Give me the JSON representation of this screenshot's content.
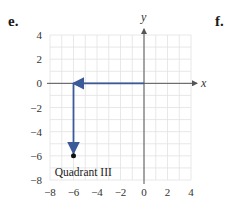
{
  "labels": {
    "left_part": "e.",
    "right_part": "f."
  },
  "colors": {
    "grid": "#e2e2e2",
    "axis": "#555555",
    "path": "#3c5a9a",
    "point": "#111111"
  },
  "chart_data": {
    "type": "scatter",
    "title": "",
    "xlabel": "x",
    "ylabel": "y",
    "xlim": [
      -8,
      4
    ],
    "ylim": [
      -8,
      4
    ],
    "grid": true,
    "x_ticks": [
      -8,
      -6,
      -4,
      -2,
      0,
      2,
      4
    ],
    "y_ticks": [
      4,
      2,
      0,
      -2,
      -4,
      -6,
      -8
    ],
    "x_tick_labels": [
      "−8",
      "−6",
      "−4",
      "−2",
      "0",
      "2",
      "4"
    ],
    "y_tick_labels": [
      "4",
      "2",
      "0",
      "−2",
      "−4",
      "−6",
      "−8"
    ],
    "points": [
      {
        "x": -6,
        "y": -6
      }
    ],
    "path_arrows": [
      {
        "from": [
          0,
          0
        ],
        "to": [
          -6,
          0
        ]
      },
      {
        "from": [
          -6,
          0
        ],
        "to": [
          -6,
          -6
        ]
      }
    ],
    "annotations": [
      {
        "text": "Quadrant III",
        "x": -7.6,
        "y": -7.3
      }
    ]
  }
}
